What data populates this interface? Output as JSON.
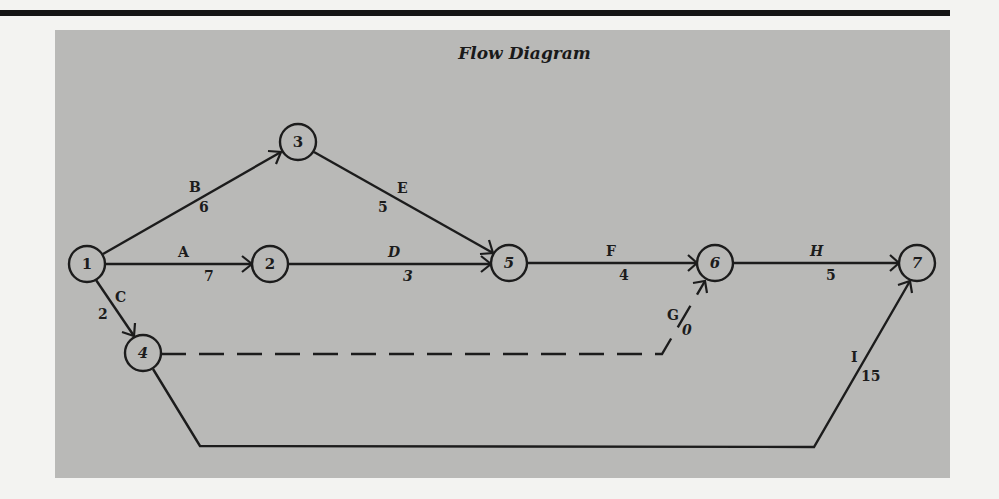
{
  "title": "Flow Diagram",
  "colors": {
    "panel": "#b9b9b7",
    "ink": "#1c1c1c",
    "page": "#f3f3f1"
  },
  "nodes": [
    {
      "id": "1",
      "label": "1",
      "x": 87,
      "y": 264
    },
    {
      "id": "2",
      "label": "2",
      "x": 270,
      "y": 264
    },
    {
      "id": "3",
      "label": "3",
      "x": 298,
      "y": 142
    },
    {
      "id": "4",
      "label": "4",
      "x": 143,
      "y": 353
    },
    {
      "id": "5",
      "label": "5",
      "x": 509,
      "y": 263
    },
    {
      "id": "6",
      "label": "6",
      "x": 715,
      "y": 263
    },
    {
      "id": "7",
      "label": "7",
      "x": 917,
      "y": 263
    }
  ],
  "edges": [
    {
      "activity": "A",
      "duration": "7",
      "from": "1",
      "to": "2",
      "dashed": false
    },
    {
      "activity": "B",
      "duration": "6",
      "from": "1",
      "to": "3",
      "dashed": false
    },
    {
      "activity": "C",
      "duration": "2",
      "from": "1",
      "to": "4",
      "dashed": false
    },
    {
      "activity": "D",
      "duration": "3",
      "from": "2",
      "to": "5",
      "dashed": false
    },
    {
      "activity": "E",
      "duration": "5",
      "from": "3",
      "to": "5",
      "dashed": false
    },
    {
      "activity": "F",
      "duration": "4",
      "from": "5",
      "to": "6",
      "dashed": false
    },
    {
      "activity": "G",
      "duration": "0",
      "from": "4",
      "to": "6",
      "dashed": true
    },
    {
      "activity": "H",
      "duration": "5",
      "from": "6",
      "to": "7",
      "dashed": false
    },
    {
      "activity": "I",
      "duration": "15",
      "from": "4",
      "to": "7",
      "dashed": false
    }
  ]
}
